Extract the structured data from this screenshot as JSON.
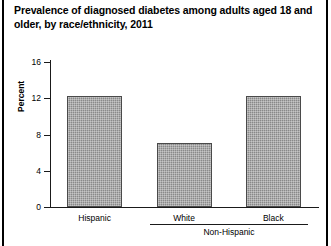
{
  "figure": {
    "title": "Prevalence of diagnosed diabetes among adults aged 18 and older, by race/ethnicity, 2011",
    "frame_color": "#000000",
    "bar_fill_color": "#8f8f8f",
    "bar_edge_color": "#4a4a4a",
    "axis_color": "#1a1a1a",
    "background_color": "#ffffff"
  },
  "chart_data": {
    "type": "bar",
    "title": "Prevalence of diagnosed diabetes among adults aged 18 and older, by race/ethnicity, 2011",
    "subtitle": "",
    "xlabel": "",
    "ylabel": "Percent",
    "categories": [
      "Hispanic",
      "White",
      "Black"
    ],
    "values": [
      12.3,
      7.1,
      12.2
    ],
    "series": [
      {
        "name": "Percent of adults with diagnosed diabetes",
        "values": [
          12.3,
          7.1,
          12.2
        ]
      }
    ],
    "group_brackets": [
      {
        "label": "Non-Hispanic",
        "categories": [
          "White",
          "Black"
        ]
      }
    ],
    "ylim": [
      0,
      16
    ],
    "yticks": [
      0,
      4,
      8,
      12,
      16
    ],
    "ytick_labels": [
      "0",
      "4",
      "8",
      "12",
      "16"
    ],
    "grid": false,
    "legend": false,
    "legend_position": "none",
    "annotations": []
  },
  "y_axis": {
    "label": "Percent",
    "ticks": [
      {
        "value": 16,
        "label": "16"
      },
      {
        "value": 12,
        "label": "12"
      },
      {
        "value": 8,
        "label": "8"
      },
      {
        "value": 4,
        "label": "4"
      },
      {
        "value": 0,
        "label": "0"
      }
    ]
  },
  "x_axis": {
    "categories": [
      {
        "label": "Hispanic",
        "value": 12.3
      },
      {
        "label": "White",
        "value": 7.1
      },
      {
        "label": "Black",
        "value": 12.2
      }
    ],
    "group_label": "Non-Hispanic"
  }
}
